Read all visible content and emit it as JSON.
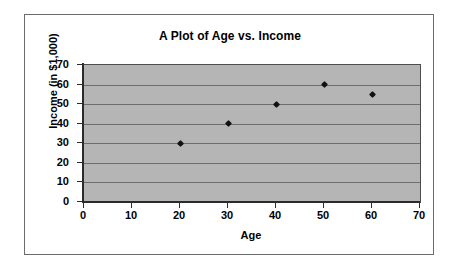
{
  "chart_data": {
    "type": "scatter",
    "title": "A Plot of Age vs. Income",
    "xlabel": "Age",
    "ylabel": "Income (in $1,000)",
    "xlim": [
      0,
      70
    ],
    "ylim": [
      0,
      70
    ],
    "x_ticks": [
      0,
      10,
      20,
      30,
      40,
      50,
      60,
      70
    ],
    "y_ticks": [
      0,
      10,
      20,
      30,
      40,
      50,
      60,
      70
    ],
    "x_tick_labels": [
      "0",
      "10",
      "20",
      "30",
      "40",
      "50",
      "60",
      "70"
    ],
    "y_tick_labels": [
      "0",
      "10",
      "20",
      "30",
      "40",
      "50",
      "60",
      "70"
    ],
    "grid": "horizontal",
    "legend": "none",
    "plot_background": "#b5b5b5",
    "marker_color": "#111111",
    "marker_shape": "diamond",
    "series": [
      {
        "name": "Income",
        "points": [
          {
            "x": 20,
            "y": 30
          },
          {
            "x": 30,
            "y": 40
          },
          {
            "x": 40,
            "y": 50
          },
          {
            "x": 50,
            "y": 60
          },
          {
            "x": 60,
            "y": 55
          }
        ]
      }
    ]
  }
}
